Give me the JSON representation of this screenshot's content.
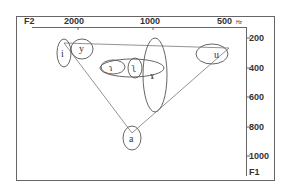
{
  "diagram": {
    "type": "vowel-formant-chart",
    "x_axis": {
      "label": "F2",
      "unit": "Hz",
      "ticks": [
        "2000",
        "1000",
        "500"
      ]
    },
    "y_axis": {
      "label": "F1",
      "ticks": [
        "200",
        "400",
        "600",
        "800",
        "1000"
      ]
    },
    "vowels": [
      {
        "symbol": "i",
        "name": "vowel-i"
      },
      {
        "symbol": "y",
        "name": "vowel-y"
      },
      {
        "symbol": "ɿ",
        "name": "vowel-apical-dental"
      },
      {
        "symbol": "ʅ",
        "name": "vowel-apical-retroflex"
      },
      {
        "symbol": "ɤ",
        "name": "vowel-ram-horn"
      },
      {
        "symbol": "u",
        "name": "vowel-u"
      },
      {
        "symbol": "a",
        "name": "vowel-a"
      }
    ],
    "colors": {
      "line": "#555555",
      "text": "#333333",
      "background": "#ffffff"
    }
  }
}
